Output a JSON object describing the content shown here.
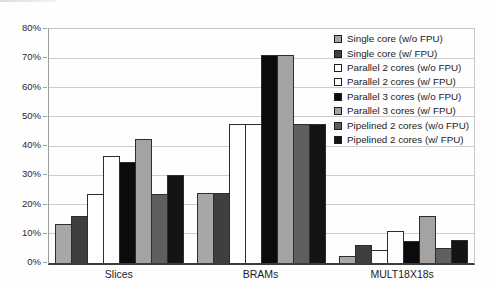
{
  "chart_data": {
    "type": "bar",
    "title": "",
    "xlabel": "",
    "ylabel": "",
    "categories": [
      "Slices",
      "BRAMs",
      "MULT18X18s"
    ],
    "series": [
      {
        "name": "Single core (w/o FPU)",
        "color": "#A8A8A8",
        "values": [
          13.5,
          24,
          2.5
        ]
      },
      {
        "name": "Single core (w/ FPU)",
        "color": "#3F3F3F",
        "values": [
          16,
          24,
          6
        ]
      },
      {
        "name": "Parallel 2 cores (w/o FPU)",
        "color": "#FFFFFF",
        "values": [
          23.5,
          47.5,
          4.5
        ]
      },
      {
        "name": "Parallel 2 cores (w/ FPU)",
        "color": "#FDFDFD",
        "values": [
          36.5,
          47.5,
          11
        ]
      },
      {
        "name": "Parallel 3 cores (w/o FPU)",
        "color": "#0B0B0B",
        "values": [
          34.5,
          71,
          7.5
        ]
      },
      {
        "name": "Parallel 3 cores (w/ FPU)",
        "color": "#A3A3A3",
        "values": [
          42.5,
          71,
          16
        ]
      },
      {
        "name": "Pipelined 2 cores (w/o FPU)",
        "color": "#5F5F5F",
        "values": [
          23.5,
          47.5,
          5
        ]
      },
      {
        "name": "Pipelined 2 cores (w/ FPU)",
        "color": "#141414",
        "values": [
          30,
          47.5,
          8
        ]
      }
    ],
    "ylim": [
      0,
      80
    ],
    "ytick_step": 10,
    "ytick_labels": [
      "0%",
      "10%",
      "20%",
      "30%",
      "40%",
      "50%",
      "60%",
      "70%",
      "80%"
    ],
    "grid": "horizontal",
    "legend_position": "top-right"
  }
}
